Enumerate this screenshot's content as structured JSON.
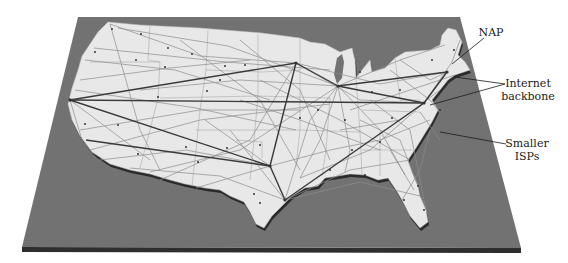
{
  "figure": {
    "board_color": "#6e6e6e",
    "land_color": "#e9e9e9",
    "backbone_color": "#3a3a3a",
    "isp_line_color": "#8a8a8a"
  },
  "labels": {
    "nap": "NAP",
    "backbone_line1": "Internet",
    "backbone_line2": "backbone",
    "isps_line1": "Smaller",
    "isps_line2": "ISPs"
  },
  "hubs": [
    {
      "name": "west-coast-hub",
      "x": 70,
      "y": 100
    },
    {
      "name": "minneapolis-hub",
      "x": 296,
      "y": 63
    },
    {
      "name": "chicago-hub",
      "x": 338,
      "y": 86
    },
    {
      "name": "dallas-hub",
      "x": 270,
      "y": 166
    },
    {
      "name": "houston-hub",
      "x": 285,
      "y": 200
    },
    {
      "name": "washington-hub",
      "x": 424,
      "y": 103
    },
    {
      "name": "new-york-hub",
      "x": 447,
      "y": 72
    }
  ]
}
